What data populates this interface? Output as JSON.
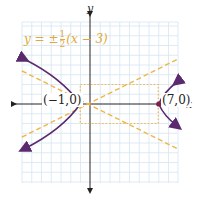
{
  "diagram": {
    "type": "hyperbola graph",
    "axes": {
      "x_label": "x",
      "y_label": "y"
    },
    "asymptote_label": {
      "prefix": "y = ±",
      "num": "1",
      "den": "2",
      "suffix": "(x − 3)"
    },
    "vertices": [
      {
        "label": "(−1,0)",
        "x": -1,
        "y": 0
      },
      {
        "label": "(7,0)",
        "x": 7,
        "y": 0
      }
    ],
    "center": {
      "x": 3,
      "y": 0
    },
    "fundamental_rectangle": {
      "x_min": -1,
      "x_max": 7,
      "y_min": -2,
      "y_max": 2
    },
    "colors": {
      "curve": "#5b2a6e",
      "vertex": "#7a1f4a",
      "asymptote": "#f0b547",
      "rectangle": "#f0b547",
      "grid": "#d6e6f2",
      "axis": "#222222",
      "label_asymptote": "#e0a93a"
    }
  }
}
